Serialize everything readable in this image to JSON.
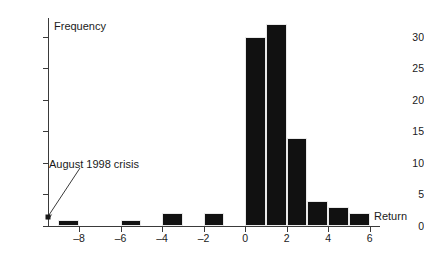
{
  "chart_data": {
    "type": "bar",
    "title": "",
    "subtitle": "",
    "xlabel": "Return",
    "ylabel": "Frequency",
    "xlim": [
      -9.5,
      6.5
    ],
    "ylim": [
      0,
      33
    ],
    "grid": false,
    "legend": "none",
    "bin_width": 1,
    "x_ticks": [
      -8,
      -6,
      -4,
      -2,
      0,
      2,
      4,
      6
    ],
    "x_tick_labels": [
      "–8",
      "–6",
      "–4",
      "–2",
      "0",
      "2",
      "4",
      "6"
    ],
    "y_ticks": [
      0,
      5,
      10,
      15,
      20,
      25,
      30
    ],
    "y_tick_labels": [
      "0",
      "5",
      "10",
      "15",
      "20",
      "25",
      "30"
    ],
    "bins": [
      {
        "left": -9,
        "right": -8,
        "value": 1
      },
      {
        "left": -6,
        "right": -5,
        "value": 1
      },
      {
        "left": -4,
        "right": -3,
        "value": 2
      },
      {
        "left": -2,
        "right": -1,
        "value": 2
      },
      {
        "left": 0,
        "right": 1,
        "value": 30
      },
      {
        "left": 1,
        "right": 2,
        "value": 32
      },
      {
        "left": 2,
        "right": 3,
        "value": 14
      },
      {
        "left": 3,
        "right": 4,
        "value": 4
      },
      {
        "left": 4,
        "right": 5,
        "value": 3
      },
      {
        "left": 5,
        "right": 6,
        "value": 2
      }
    ],
    "categories": [
      "-9",
      "-6",
      "-4",
      "-2",
      "0",
      "1",
      "2",
      "3",
      "4",
      "5"
    ],
    "values": [
      1,
      1,
      2,
      2,
      30,
      32,
      14,
      4,
      3,
      2
    ],
    "annotations": [
      {
        "text": "August 1998 crisis",
        "points_to_bin": -9,
        "arrow": "down-left"
      }
    ],
    "colors": {
      "bar": "#111111",
      "axis": "#3a3a3a",
      "text": "#1a1a1a",
      "background": "#ffffff"
    }
  }
}
